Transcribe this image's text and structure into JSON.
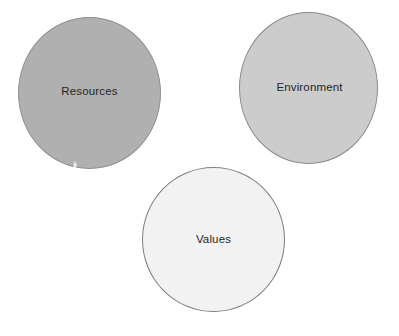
{
  "diagram": {
    "type": "venn-like-circles",
    "background_color": "#ffffff",
    "circles": [
      {
        "id": "resources",
        "label": "Resources",
        "fill_color": "#b0b0b0",
        "border_color": "#8f8f8f",
        "text_color": "#262626"
      },
      {
        "id": "environment",
        "label": "Environment",
        "fill_color": "#cccccc",
        "border_color": "#8a8a8a",
        "text_color": "#262626"
      },
      {
        "id": "values",
        "label": "Values",
        "fill_color": "#f2f2f2",
        "border_color": "#7e7e7e",
        "text_color": "#262626"
      }
    ]
  }
}
